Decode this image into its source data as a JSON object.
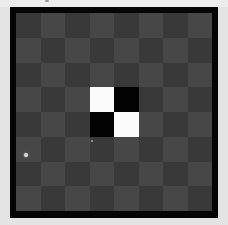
{
  "game": {
    "type": "reversi-board",
    "rows": 8,
    "cols": 8,
    "colors": {
      "frame": "#050505",
      "dark_square": "#393939",
      "light_square": "#474747",
      "white_piece": "#fbfbfb",
      "black_piece": "#030303",
      "background": "#e4e4e4"
    },
    "pieces": [
      {
        "row": 3,
        "col": 3,
        "color": "white"
      },
      {
        "row": 3,
        "col": 4,
        "color": "black"
      },
      {
        "row": 4,
        "col": 3,
        "color": "black"
      },
      {
        "row": 4,
        "col": 4,
        "color": "white"
      }
    ],
    "markers": [
      {
        "x": 24,
        "y": 153,
        "size": "normal"
      },
      {
        "x": 91,
        "y": 140,
        "size": "small"
      }
    ]
  }
}
